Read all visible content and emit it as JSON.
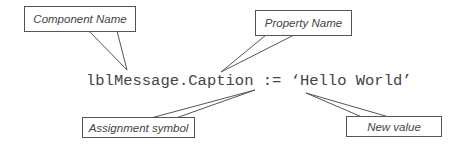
{
  "code_line": "lblMessage.Caption := ‘Hello World’",
  "callouts": {
    "component_name": "Component Name",
    "property_name": "Property Name",
    "assignment_symbol": "Assignment symbol",
    "new_value": "New value"
  },
  "colors": {
    "stroke": "#555555",
    "text": "#444444",
    "background": "#ffffff"
  }
}
